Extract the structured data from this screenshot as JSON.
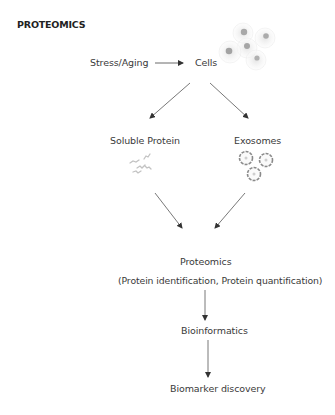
{
  "title": "PROTEOMICS",
  "nodes": {
    "stress": "Stress/Aging",
    "cells": "Cells",
    "soluble_protein": "Soluble Protein",
    "exosomes": "Exosomes",
    "proteomics": "Proteomics",
    "proteomics_detail": "(Protein identification, Protein quantification)",
    "bioinformatics": "Bioinformatics",
    "biomarker": "Biomarker discovery"
  },
  "icons": {
    "cells": "cell-cluster-icon",
    "soluble_protein": "protein-molecules-icon",
    "exosomes": "exosome-vesicles-icon"
  },
  "edges": [
    {
      "from": "Stress/Aging",
      "to": "Cells"
    },
    {
      "from": "Cells",
      "to": "Soluble Protein"
    },
    {
      "from": "Cells",
      "to": "Exosomes"
    },
    {
      "from": "Soluble Protein",
      "to": "Proteomics"
    },
    {
      "from": "Exosomes",
      "to": "Proteomics"
    },
    {
      "from": "Proteomics",
      "to": "Bioinformatics"
    },
    {
      "from": "Bioinformatics",
      "to": "Biomarker discovery"
    }
  ]
}
